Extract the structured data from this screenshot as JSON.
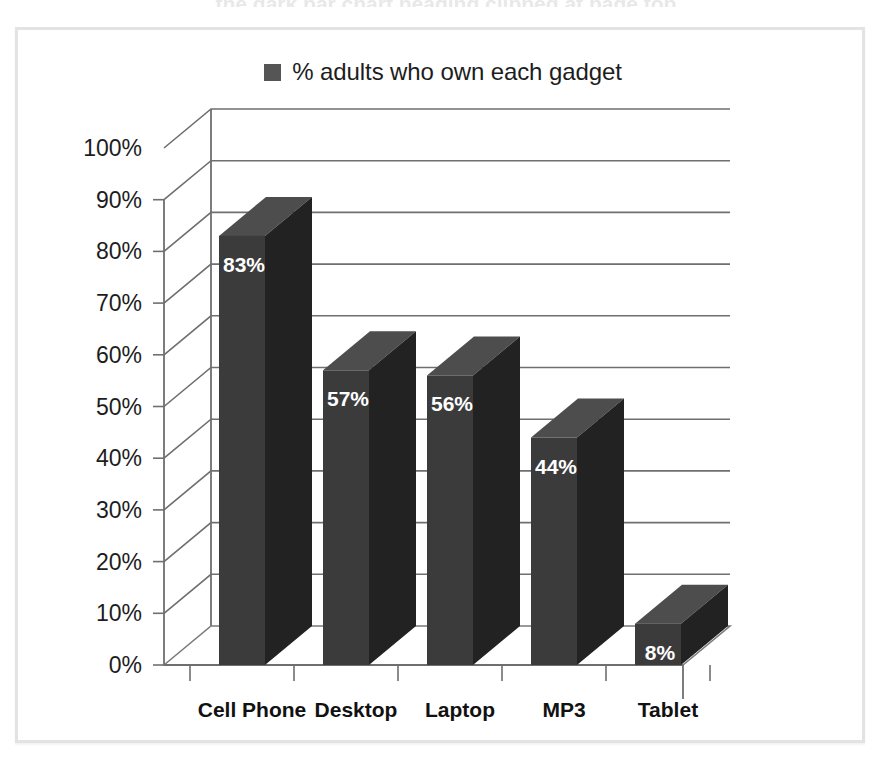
{
  "scan_artifact": {
    "text": "the dark bar chart heading clipped at page top"
  },
  "legend": {
    "label": "% adults who own each gadget",
    "swatch_color": "#555555",
    "swatch_icon": "legend-square-icon"
  },
  "frame": {
    "border_color": "#e3e3e3",
    "background": "#ffffff"
  },
  "chart_data": {
    "type": "bar",
    "title": "",
    "subtitle": "",
    "xlabel": "",
    "ylabel": "",
    "categories": [
      "Cell Phone",
      "Desktop",
      "Laptop",
      "MP3",
      "Tablet"
    ],
    "values": [
      83,
      57,
      56,
      44,
      8
    ],
    "value_labels": [
      "83%",
      "57%",
      "56%",
      "44%",
      "8%"
    ],
    "series": [
      {
        "name": "% adults who own each gadget",
        "values": [
          83,
          57,
          56,
          44,
          8
        ],
        "color": "#3b3b3b"
      }
    ],
    "ylim": [
      0,
      100
    ],
    "ytick_step": 10,
    "ytick_labels": [
      "0%",
      "10%",
      "20%",
      "30%",
      "40%",
      "50%",
      "60%",
      "70%",
      "80%",
      "90%",
      "100%"
    ],
    "ytick_values": [
      0,
      10,
      20,
      30,
      40,
      50,
      60,
      70,
      80,
      90,
      100
    ],
    "grid": true,
    "grid_axis": "y",
    "legend_position": "top-center",
    "three_d": true,
    "bar_colors": {
      "front": "#3b3b3b",
      "side": "#222222",
      "top": "#4d4d4d"
    }
  }
}
